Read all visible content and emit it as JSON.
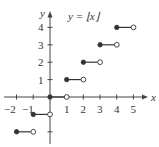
{
  "chart_data": {
    "type": "line",
    "title": "y = ⌊x⌋",
    "xlabel": "x",
    "ylabel": "y",
    "xlim": [
      -2.2,
      5.8
    ],
    "ylim": [
      -2.6,
      4.9
    ],
    "grid": false,
    "x_tick_labels": [
      "−2",
      "−1",
      "1",
      "2",
      "3",
      "4",
      "5"
    ],
    "y_tick_labels": [
      "1",
      "2",
      "3",
      "4"
    ],
    "segments": [
      {
        "x_start": -2,
        "x_end": -1,
        "y": -2,
        "start": "closed",
        "end": "open"
      },
      {
        "x_start": -1,
        "x_end": 0,
        "y": -1,
        "start": "closed",
        "end": "open"
      },
      {
        "x_start": 0,
        "x_end": 1,
        "y": 0,
        "start": "closed",
        "end": "open"
      },
      {
        "x_start": 1,
        "x_end": 2,
        "y": 1,
        "start": "closed",
        "end": "open"
      },
      {
        "x_start": 2,
        "x_end": 3,
        "y": 2,
        "start": "closed",
        "end": "open"
      },
      {
        "x_start": 3,
        "x_end": 4,
        "y": 3,
        "start": "closed",
        "end": "open"
      },
      {
        "x_start": 4,
        "x_end": 5,
        "y": 4,
        "start": "closed",
        "end": "open"
      }
    ]
  },
  "labels": {
    "title": "y = ⌊x⌋",
    "x_axis": "x",
    "y_axis": "y",
    "x_ticks": {
      "m2": "−2",
      "m1": "−1",
      "p1": "1",
      "p2": "2",
      "p3": "3",
      "p4": "4",
      "p5": "5"
    },
    "y_ticks": {
      "p1": "1",
      "p2": "2",
      "p3": "3",
      "p4": "4"
    }
  }
}
